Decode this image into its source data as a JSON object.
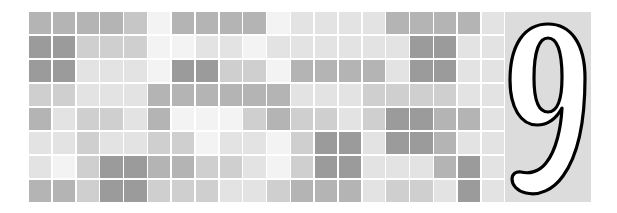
{
  "page": {
    "background_color": "#ffffff",
    "width": 617,
    "height": 213
  },
  "mosaic": {
    "name": "gray-tile-mosaic",
    "columns": 20,
    "rows": 8,
    "gap_color": "#ffffff",
    "palette": {
      "dark": "#9b9b9b",
      "mid": "#b4b4b4",
      "light": "#cfcfcf",
      "lighter": "#e3e3e3",
      "lightest": "#f3f3f3"
    },
    "grid": [
      [
        "#b4b4b4",
        "#b4b4b4",
        "#b4b4b4",
        "#b4b4b4",
        "#c6c6c6",
        "#f3f3f3",
        "#b4b4b4",
        "#b4b4b4",
        "#b4b4b4",
        "#b4b4b4",
        "#f3f3f3",
        "#e3e3e3",
        "#e3e3e3",
        "#e3e3e3",
        "#e3e3e3",
        "#b4b4b4",
        "#b4b4b4",
        "#b4b4b4",
        "#b4b4b4",
        "#e3e3e3"
      ],
      [
        "#9b9b9b",
        "#9b9b9b",
        "#cfcfcf",
        "#cfcfcf",
        "#cfcfcf",
        "#f3f3f3",
        "#f3f3f3",
        "#e3e3e3",
        "#e3e3e3",
        "#f3f3f3",
        "#e3e3e3",
        "#e3e3e3",
        "#e3e3e3",
        "#e3e3e3",
        "#e3e3e3",
        "#e3e3e3",
        "#9b9b9b",
        "#9b9b9b",
        "#e3e3e3",
        "#e3e3e3"
      ],
      [
        "#9b9b9b",
        "#9b9b9b",
        "#e3e3e3",
        "#e3e3e3",
        "#e3e3e3",
        "#f3f3f3",
        "#9b9b9b",
        "#9b9b9b",
        "#cfcfcf",
        "#cfcfcf",
        "#f3f3f3",
        "#b4b4b4",
        "#b4b4b4",
        "#b4b4b4",
        "#b4b4b4",
        "#e3e3e3",
        "#9b9b9b",
        "#9b9b9b",
        "#e3e3e3",
        "#e3e3e3"
      ],
      [
        "#cfcfcf",
        "#cfcfcf",
        "#e3e3e3",
        "#e3e3e3",
        "#e3e3e3",
        "#b4b4b4",
        "#b4b4b4",
        "#b4b4b4",
        "#b4b4b4",
        "#b4b4b4",
        "#b4b4b4",
        "#e3e3e3",
        "#e3e3e3",
        "#e3e3e3",
        "#cfcfcf",
        "#cfcfcf",
        "#cfcfcf",
        "#cfcfcf",
        "#e3e3e3",
        "#e3e3e3"
      ],
      [
        "#b4b4b4",
        "#e3e3e3",
        "#cfcfcf",
        "#cfcfcf",
        "#e3e3e3",
        "#b4b4b4",
        "#f3f3f3",
        "#f3f3f3",
        "#f3f3f3",
        "#cfcfcf",
        "#b4b4b4",
        "#cfcfcf",
        "#cfcfcf",
        "#e3e3e3",
        "#cfcfcf",
        "#9b9b9b",
        "#9b9b9b",
        "#b4b4b4",
        "#b4b4b4",
        "#e3e3e3"
      ],
      [
        "#e3e3e3",
        "#e3e3e3",
        "#cfcfcf",
        "#e3e3e3",
        "#e3e3e3",
        "#cfcfcf",
        "#cfcfcf",
        "#f3f3f3",
        "#e3e3e3",
        "#e3e3e3",
        "#f3f3f3",
        "#cfcfcf",
        "#9b9b9b",
        "#9b9b9b",
        "#e3e3e3",
        "#9b9b9b",
        "#9b9b9b",
        "#b4b4b4",
        "#e3e3e3",
        "#e3e3e3"
      ],
      [
        "#e3e3e3",
        "#f3f3f3",
        "#cfcfcf",
        "#9b9b9b",
        "#9b9b9b",
        "#b4b4b4",
        "#b4b4b4",
        "#cfcfcf",
        "#cfcfcf",
        "#e3e3e3",
        "#f3f3f3",
        "#cfcfcf",
        "#9b9b9b",
        "#9b9b9b",
        "#e3e3e3",
        "#e3e3e3",
        "#e3e3e3",
        "#b4b4b4",
        "#9b9b9b",
        "#e3e3e3"
      ],
      [
        "#b4b4b4",
        "#b4b4b4",
        "#cfcfcf",
        "#9b9b9b",
        "#9b9b9b",
        "#cfcfcf",
        "#cfcfcf",
        "#cfcfcf",
        "#e3e3e3",
        "#e3e3e3",
        "#cfcfcf",
        "#b4b4b4",
        "#b4b4b4",
        "#b4b4b4",
        "#e3e3e3",
        "#cfcfcf",
        "#cfcfcf",
        "#e3e3e3",
        "#9b9b9b",
        "#e3e3e3"
      ]
    ]
  },
  "numeral": {
    "name": "chapter-number-nine",
    "text": "9",
    "fill_color": "#ffffff",
    "outline_color": "#000000",
    "panel_color": "#dcdcdc"
  }
}
